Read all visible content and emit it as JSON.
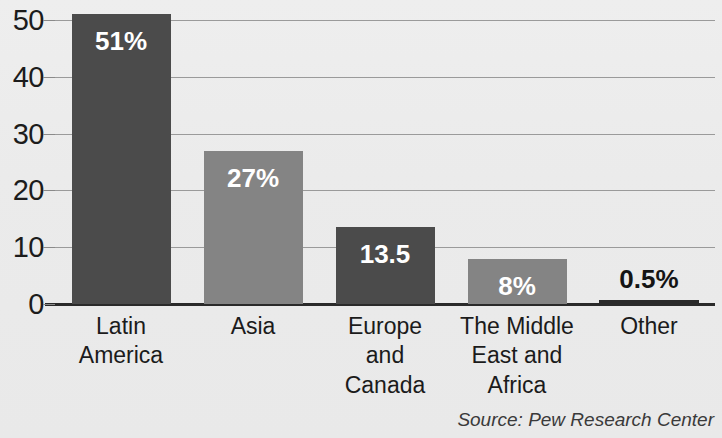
{
  "chart_data": {
    "type": "bar",
    "title": "",
    "subtitle": "",
    "xlabel": "",
    "ylabel": "",
    "categories": [
      "Latin America",
      "Asia",
      "Europe and Canada",
      "The Middle East and Africa",
      "Other"
    ],
    "category_lines": [
      [
        "Latin",
        "America"
      ],
      [
        "Asia"
      ],
      [
        "Europe",
        "and",
        "Canada"
      ],
      [
        "The Middle",
        "East and",
        "Africa"
      ],
      [
        "Other"
      ]
    ],
    "values": [
      51,
      27,
      13.5,
      8,
      0.5
    ],
    "data_labels": [
      "51%",
      "27%",
      "13.5",
      "8%",
      "0.5%"
    ],
    "label_placement": [
      "inside",
      "inside",
      "inside",
      "inside",
      "above"
    ],
    "bar_colors": [
      "#4b4b4b",
      "#848484",
      "#4b4b4b",
      "#848484",
      "#2a2a2a"
    ],
    "ylim": [
      0,
      50
    ],
    "yticks": [
      0,
      10,
      20,
      30,
      40,
      50
    ],
    "ytick_labels": [
      "0",
      "10",
      "20",
      "30",
      "40",
      "50"
    ],
    "grid": true,
    "grid_axis": "y",
    "legend": false,
    "legend_position": "none",
    "annotation": "Source: Pew Research Center",
    "background_color": "#ebebeb",
    "gridline_color": "#9a9a9a",
    "axis_color": "#2a2a2a",
    "text_color": "#1b1b1b"
  }
}
